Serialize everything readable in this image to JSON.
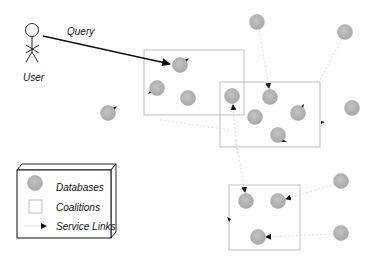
{
  "diagram": {
    "user_label": "User",
    "query_label": "Query",
    "colors": {
      "database_fill": "#b4b4b4",
      "database_stroke": "#9a9a9a",
      "coalition_stroke": "#bdbdbd",
      "service_link": "#cfcfcf",
      "arrowhead": "#111111",
      "query_line": "#111111"
    },
    "legend": {
      "items": [
        {
          "icon": "database-circle",
          "label": "Databases"
        },
        {
          "icon": "coalition-square",
          "label": "Coalitions"
        },
        {
          "icon": "service-link-arrow",
          "label": "Service Links"
        }
      ]
    },
    "coalitions": [
      {
        "x": 144,
        "y": 50,
        "w": 100,
        "h": 65
      },
      {
        "x": 220,
        "y": 82,
        "w": 100,
        "h": 65
      },
      {
        "x": 229,
        "y": 185,
        "w": 71,
        "h": 65
      }
    ],
    "databases": [
      {
        "cx": 180,
        "cy": 65
      },
      {
        "cx": 157,
        "cy": 88
      },
      {
        "cx": 188,
        "cy": 98
      },
      {
        "cx": 232,
        "cy": 96
      },
      {
        "cx": 270,
        "cy": 97
      },
      {
        "cx": 298,
        "cy": 113
      },
      {
        "cx": 255,
        "cy": 117
      },
      {
        "cx": 278,
        "cy": 135
      },
      {
        "cx": 257,
        "cy": 22
      },
      {
        "cx": 345,
        "cy": 32
      },
      {
        "cx": 352,
        "cy": 108
      },
      {
        "cx": 108,
        "cy": 113
      },
      {
        "cx": 246,
        "cy": 201
      },
      {
        "cx": 278,
        "cy": 201
      },
      {
        "cx": 258,
        "cy": 237
      },
      {
        "cx": 341,
        "cy": 181
      },
      {
        "cx": 341,
        "cy": 233
      }
    ]
  }
}
